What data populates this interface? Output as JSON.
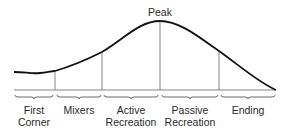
{
  "diagram": {
    "type": "phase-curve",
    "peak_label": "Peak",
    "phases": [
      {
        "line1": "First",
        "line2": "Corner",
        "x": 34
      },
      {
        "line1": "Mixers",
        "line2": "",
        "x": 79
      },
      {
        "line1": "Active",
        "line2": "Recreation",
        "x": 131
      },
      {
        "line1": "Passive",
        "line2": "Recreation",
        "x": 190
      },
      {
        "line1": "Ending",
        "line2": "",
        "x": 248
      }
    ],
    "dividers_x": [
      55,
      102,
      160,
      219
    ],
    "colors": {
      "line": "#111111",
      "thin": "#555555",
      "text": "#2a2a2a"
    }
  }
}
